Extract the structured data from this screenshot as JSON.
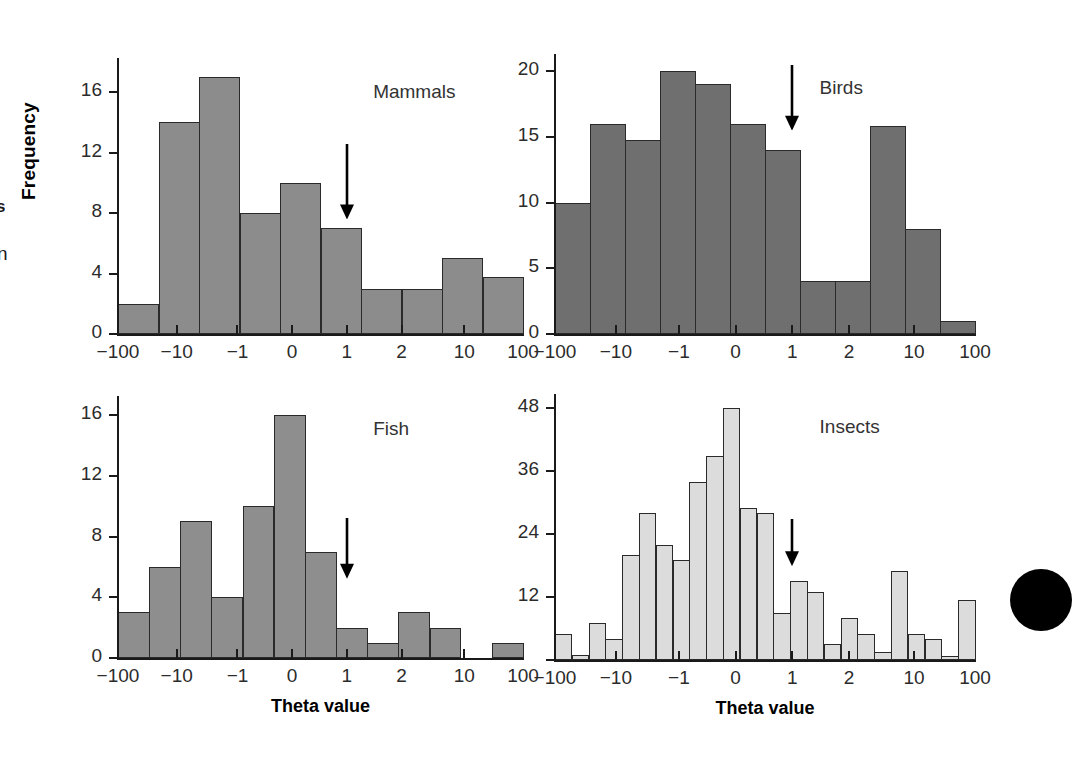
{
  "figure": {
    "y_axis_title": "Frequency",
    "x_axis_title": "Theta value",
    "margin_fragments": {
      "top": "s",
      "bottom": "n"
    },
    "colors": {
      "mammals_bar": "#8c8c8c",
      "birds_bar": "#6f6f6f",
      "fish_bar": "#8e8e8e",
      "insects_bar": "#dcdcdc",
      "bar_outline": "#2a2a2a",
      "axis": "#1a1a1a",
      "text": "#2b2b2b",
      "arrow": "#000000",
      "edge_dot": "#000000"
    },
    "annotation": {
      "arrow_icon": "down-arrow",
      "arrow_at_x_label": "1"
    }
  },
  "chart_data": [
    {
      "type": "bar",
      "title": "Mammals",
      "xlabel": "Theta value",
      "ylabel": "Frequency",
      "xticks": [
        "-100",
        "-10",
        "-1",
        "0",
        "1",
        "2",
        "10",
        "100"
      ],
      "yticks": [
        0,
        4,
        8,
        12,
        16
      ],
      "ylim": [
        0,
        18
      ],
      "grid": false,
      "legend": "none",
      "bin_edges_px": [
        0,
        1,
        2,
        3,
        4,
        5,
        6,
        7,
        8,
        9,
        10
      ],
      "values": [
        2,
        14,
        17,
        8,
        10,
        7,
        3,
        3,
        5,
        3.8
      ],
      "annotation": {
        "arrow": true,
        "arrow_x_label": "1",
        "arrow_top_y": 12.6,
        "arrow_tip_y": 7.6
      }
    },
    {
      "type": "bar",
      "title": "Birds",
      "xlabel": "Theta value",
      "ylabel": "Frequency",
      "xticks": [
        "-100",
        "-10",
        "-1",
        "0",
        "1",
        "2",
        "10",
        "100"
      ],
      "yticks": [
        0,
        5,
        10,
        15,
        20
      ],
      "ylim": [
        0,
        21
      ],
      "grid": false,
      "legend": "none",
      "values": [
        10,
        16,
        14.8,
        20,
        19,
        16,
        14,
        4,
        4,
        15.8,
        8,
        1
      ],
      "annotation": {
        "arrow": true,
        "arrow_x_label": "1",
        "arrow_top_y": 20.5,
        "arrow_tip_y": 15.5
      }
    },
    {
      "type": "bar",
      "title": "Fish",
      "xlabel": "Theta value",
      "ylabel": "Frequency",
      "xticks": [
        "-100",
        "-10",
        "-1",
        "0",
        "1",
        "2",
        "10",
        "100"
      ],
      "yticks": [
        0,
        4,
        8,
        12,
        16
      ],
      "ylim": [
        0,
        17
      ],
      "grid": false,
      "legend": "none",
      "values": [
        3,
        6,
        9,
        4,
        10,
        16,
        7,
        2,
        1,
        3,
        2,
        0,
        1
      ],
      "annotation": {
        "arrow": true,
        "arrow_x_label": "1",
        "arrow_top_y": 9.2,
        "arrow_tip_y": 5.2
      }
    },
    {
      "type": "bar",
      "title": "Insects",
      "xlabel": "Theta value",
      "ylabel": "Frequency",
      "xticks": [
        "-100",
        "-10",
        "-1",
        "0",
        "1",
        "2",
        "10",
        "100"
      ],
      "yticks": [
        12,
        24,
        36,
        48
      ],
      "ylim": [
        0,
        50
      ],
      "grid": false,
      "legend": "none",
      "values": [
        5,
        1,
        7,
        4,
        20,
        28,
        22,
        19,
        34,
        39,
        48,
        29,
        28,
        9,
        15,
        13,
        3,
        8,
        5,
        1.5,
        17,
        5,
        4,
        0.8,
        11.5
      ],
      "annotation": {
        "arrow": true,
        "arrow_x_label": "1",
        "arrow_top_y": 27,
        "arrow_tip_y": 18
      }
    }
  ],
  "panels": [
    {
      "name": "mammals",
      "title": "Mammals"
    },
    {
      "name": "birds",
      "title": "Birds"
    },
    {
      "name": "fish",
      "title": "Fish"
    },
    {
      "name": "insects",
      "title": "Insects"
    }
  ]
}
